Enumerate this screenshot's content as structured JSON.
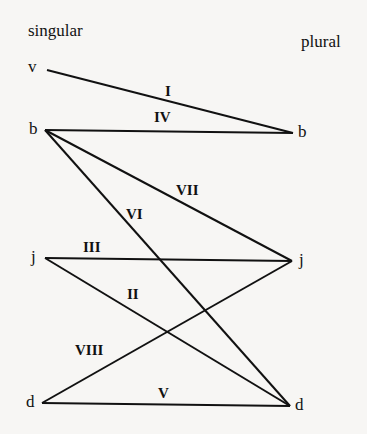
{
  "headers": {
    "left": "singular",
    "right": "plural"
  },
  "nodes": {
    "singular": [
      {
        "id": "v_s",
        "label": "v",
        "x": 47,
        "y": 70,
        "lx": 28,
        "ly": 58
      },
      {
        "id": "b_s",
        "label": "b",
        "x": 45,
        "y": 130,
        "lx": 29,
        "ly": 120
      },
      {
        "id": "j_s",
        "label": "j",
        "x": 45,
        "y": 258,
        "lx": 31,
        "ly": 248
      },
      {
        "id": "d_s",
        "label": "d",
        "x": 42,
        "y": 403,
        "lx": 26,
        "ly": 393
      }
    ],
    "plural": [
      {
        "id": "b_p",
        "label": "b",
        "x": 293,
        "y": 133,
        "lx": 298,
        "ly": 123
      },
      {
        "id": "j_p",
        "label": "j",
        "x": 292,
        "y": 261,
        "lx": 299,
        "ly": 251
      },
      {
        "id": "d_p",
        "label": "d",
        "x": 290,
        "y": 406,
        "lx": 295,
        "ly": 396
      }
    ]
  },
  "edges": [
    {
      "label": "I",
      "from": "v_s",
      "to": "b_p",
      "lx": 165,
      "ly": 84
    },
    {
      "label": "IV",
      "from": "b_s",
      "to": "b_p",
      "lx": 154,
      "ly": 110
    },
    {
      "label": "VII",
      "from": "b_s",
      "to": "j_p",
      "lx": 176,
      "ly": 183
    },
    {
      "label": "VI",
      "from": "b_s",
      "to": "d_p",
      "lx": 126,
      "ly": 207
    },
    {
      "label": "III",
      "from": "j_s",
      "to": "j_p",
      "lx": 83,
      "ly": 240
    },
    {
      "label": "II",
      "from": "j_s",
      "to": "d_p",
      "lx": 127,
      "ly": 287
    },
    {
      "label": "VIII",
      "from": "d_s",
      "to": "j_p",
      "lx": 75,
      "ly": 343
    },
    {
      "label": "V",
      "from": "d_s",
      "to": "d_p",
      "lx": 158,
      "ly": 386
    }
  ]
}
